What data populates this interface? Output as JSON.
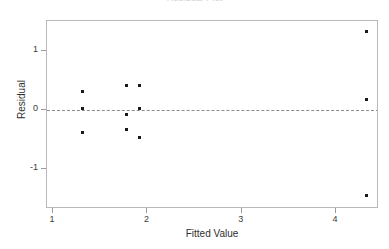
{
  "chart_data": {
    "type": "scatter",
    "title": "Residual Plot",
    "xlabel": "Fitted Value",
    "ylabel": "Residual",
    "xlim": [
      0.935,
      4.455
    ],
    "ylim": [
      -1.69,
      1.517
    ],
    "xticks": [
      1,
      2,
      3,
      4
    ],
    "xtick_labels": [
      "1",
      "2",
      "3",
      "4"
    ],
    "yticks": [
      1,
      0,
      -1
    ],
    "ytick_labels": [
      "1",
      "0",
      "-1"
    ],
    "grid": false,
    "legend": false,
    "reference_lines": [
      {
        "name": "zero-line",
        "orientation": "horizontal",
        "y": 0,
        "style": "dashed",
        "color": "#8a8a8f"
      }
    ],
    "marker": {
      "shape": "square",
      "size": 3,
      "color": "#1a1a1a"
    },
    "points": [
      {
        "x": 1.31,
        "y": 0.32
      },
      {
        "x": 1.31,
        "y": 0.02
      },
      {
        "x": 1.31,
        "y": -0.38
      },
      {
        "x": 1.78,
        "y": 0.41
      },
      {
        "x": 1.78,
        "y": -0.07
      },
      {
        "x": 1.78,
        "y": -0.34
      },
      {
        "x": 1.92,
        "y": 0.41
      },
      {
        "x": 1.92,
        "y": 0.03
      },
      {
        "x": 1.92,
        "y": -0.47
      },
      {
        "x": 4.32,
        "y": 1.33
      },
      {
        "x": 4.32,
        "y": 0.17
      },
      {
        "x": 4.32,
        "y": -1.46
      }
    ]
  },
  "colors": {
    "marker": "#1a1a1a",
    "frame": "#b9b9bd",
    "reference_line": "#8a8a8f",
    "text": "#2f2f2f",
    "background": "#ffffff"
  }
}
